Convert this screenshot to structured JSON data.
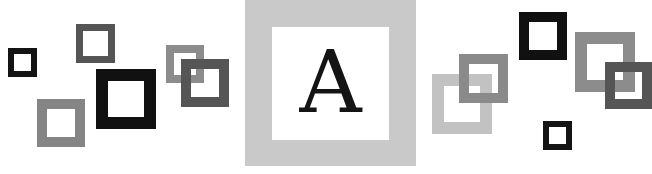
{
  "center": {
    "letter": "A",
    "frame_color": "#c9c9c9",
    "inner_color": "#ffffff",
    "letter_color": "#141414"
  },
  "squares": [
    {
      "name": "small-black-square-left",
      "x": 8,
      "y": 48,
      "size": 29,
      "border": 6,
      "color": "#141414"
    },
    {
      "name": "dark-gray-square-top-left",
      "x": 76,
      "y": 24,
      "size": 39,
      "border": 7,
      "color": "#555555"
    },
    {
      "name": "gray-square-bottom-left",
      "x": 37,
      "y": 99,
      "size": 48,
      "border": 10,
      "color": "#858585"
    },
    {
      "name": "large-black-square-left",
      "x": 96,
      "y": 69,
      "size": 60,
      "border": 12,
      "color": "#111111"
    },
    {
      "name": "gray-square-mid-left",
      "x": 166,
      "y": 45,
      "size": 38,
      "border": 8,
      "color": "#8c8c8c"
    },
    {
      "name": "dark-gray-square-mid-left",
      "x": 181,
      "y": 59,
      "size": 48,
      "border": 10,
      "color": "#555555"
    },
    {
      "name": "light-gray-square-right",
      "x": 432,
      "y": 74,
      "size": 60,
      "border": 12,
      "color": "#c2c2c2"
    },
    {
      "name": "gray-square-right",
      "x": 459,
      "y": 54,
      "size": 49,
      "border": 10,
      "color": "#8a8a8a"
    },
    {
      "name": "black-square-top-right",
      "x": 519,
      "y": 12,
      "size": 48,
      "border": 10,
      "color": "#111111"
    },
    {
      "name": "small-black-square-bottom-right",
      "x": 543,
      "y": 121,
      "size": 29,
      "border": 6,
      "color": "#141414"
    },
    {
      "name": "gray-square-far-right",
      "x": 575,
      "y": 32,
      "size": 60,
      "border": 12,
      "color": "#8c8c8c"
    },
    {
      "name": "dark-gray-square-far-right",
      "x": 605,
      "y": 62,
      "size": 47,
      "border": 10,
      "color": "#555555"
    }
  ]
}
